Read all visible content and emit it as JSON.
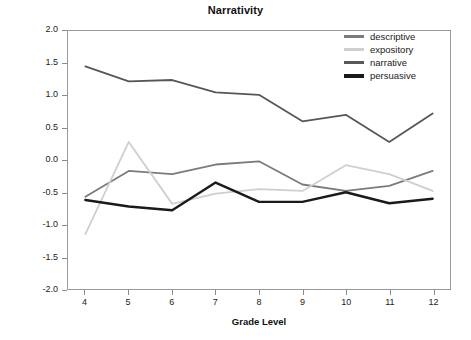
{
  "chart_data": {
    "type": "line",
    "title": "Narrativity",
    "xlabel": "Grade Level",
    "ylabel": "Mean Trait Score",
    "x": [
      4,
      5,
      6,
      7,
      8,
      9,
      10,
      11,
      12
    ],
    "categories": [
      "4",
      "5",
      "6",
      "7",
      "8",
      "9",
      "10",
      "11",
      "12"
    ],
    "xlim": [
      3.6,
      12.4
    ],
    "ylim": [
      -2.0,
      2.0
    ],
    "y_ticks": [
      "2.0",
      "1.5",
      "1.0",
      "0.5",
      "0.0",
      "-0.5",
      "-1.0",
      "-1.5",
      "-2.0"
    ],
    "y_tick_values": [
      2.0,
      1.5,
      1.0,
      0.5,
      0.0,
      -0.5,
      -1.0,
      -1.5,
      -2.0
    ],
    "grid": false,
    "legend_position": "top-right",
    "series": [
      {
        "name": "descriptive",
        "color": "#7b7b7b",
        "width": 1.8,
        "values": [
          -0.57,
          -0.17,
          -0.22,
          -0.07,
          -0.02,
          -0.38,
          -0.48,
          -0.4,
          -0.17
        ]
      },
      {
        "name": "expository",
        "color": "#cfcfcf",
        "width": 1.8,
        "values": [
          -1.15,
          0.28,
          -0.68,
          -0.52,
          -0.45,
          -0.48,
          -0.08,
          -0.22,
          -0.48
        ]
      },
      {
        "name": "narrative",
        "color": "#575757",
        "width": 1.8,
        "values": [
          1.45,
          1.22,
          1.24,
          1.05,
          1.01,
          0.6,
          0.7,
          0.28,
          0.72
        ]
      },
      {
        "name": "persuasive",
        "color": "#1a1a1a",
        "width": 2.4,
        "values": [
          -0.62,
          -0.72,
          -0.78,
          -0.35,
          -0.65,
          -0.65,
          -0.5,
          -0.67,
          -0.6
        ]
      }
    ]
  },
  "legend": {
    "items": [
      {
        "label": "descriptive",
        "color": "#7b7b7b"
      },
      {
        "label": "expository",
        "color": "#cfcfcf"
      },
      {
        "label": "narrative",
        "color": "#575757"
      },
      {
        "label": "persuasive",
        "color": "#1a1a1a"
      }
    ]
  }
}
